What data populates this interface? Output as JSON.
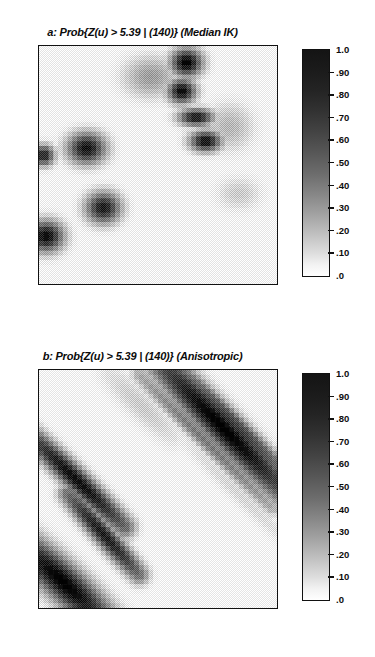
{
  "figure": {
    "background": "#ffffff",
    "ink": "#111111"
  },
  "panels": [
    {
      "id": "panel-a",
      "title": "a: Prob{Z(u) > 5.39 | (140)} (Median IK)",
      "label": "a",
      "estimator": "Median IK",
      "threshold": "5.39",
      "conditioning": "(140)"
    },
    {
      "id": "panel-b",
      "title": "b: Prob{Z(u) > 5.39 | (140)} (Anisotropic)",
      "label": "b",
      "estimator": "Anisotropic",
      "threshold": "5.39",
      "conditioning": "(140)"
    }
  ],
  "colorbar": {
    "min_label": ".0",
    "max_label": "1.0",
    "orientation": "vertical",
    "tick_labels": [
      "1.0",
      ".90",
      ".80",
      ".70",
      ".60",
      ".50",
      ".40",
      ".30",
      ".20",
      ".10",
      ".0"
    ],
    "tick_values": [
      1.0,
      0.9,
      0.8,
      0.7,
      0.6,
      0.5,
      0.4,
      0.3,
      0.2,
      0.1,
      0.0
    ],
    "high_color": "#141414",
    "low_color": "#ffffff"
  },
  "chart_data": [
    {
      "type": "heatmap",
      "panel": "a",
      "title": "a: Prob{Z(u) > 5.39 | (140)} (Median IK)",
      "xlabel": "",
      "ylabel": "",
      "grid": false,
      "legend": "colorbar-right",
      "zlim": [
        0.0,
        1.0
      ],
      "colormap": "grayscale-inverted",
      "nx": 50,
      "ny": 50,
      "description": "Median indicator kriging probability map: smooth low-probability background with compact high-probability blobs clustered in the upper-centre/right and along the left margin.",
      "hotspots": [
        {
          "cx": 0.62,
          "cy": 0.07,
          "rx": 0.09,
          "ry": 0.08,
          "peak": 1.0
        },
        {
          "cx": 0.6,
          "cy": 0.19,
          "rx": 0.08,
          "ry": 0.07,
          "peak": 0.97
        },
        {
          "cx": 0.66,
          "cy": 0.3,
          "rx": 0.1,
          "ry": 0.05,
          "peak": 0.92
        },
        {
          "cx": 0.7,
          "cy": 0.4,
          "rx": 0.09,
          "ry": 0.06,
          "peak": 0.95
        },
        {
          "cx": 0.2,
          "cy": 0.43,
          "rx": 0.11,
          "ry": 0.09,
          "peak": 0.93
        },
        {
          "cx": 0.02,
          "cy": 0.46,
          "rx": 0.06,
          "ry": 0.06,
          "peak": 0.88
        },
        {
          "cx": 0.27,
          "cy": 0.68,
          "rx": 0.1,
          "ry": 0.09,
          "peak": 0.9
        },
        {
          "cx": 0.03,
          "cy": 0.8,
          "rx": 0.1,
          "ry": 0.09,
          "peak": 0.96
        },
        {
          "cx": 0.47,
          "cy": 0.13,
          "rx": 0.16,
          "ry": 0.12,
          "peak": 0.4
        },
        {
          "cx": 0.8,
          "cy": 0.34,
          "rx": 0.14,
          "ry": 0.14,
          "peak": 0.3
        },
        {
          "cx": 0.84,
          "cy": 0.62,
          "rx": 0.13,
          "ry": 0.1,
          "peak": 0.22
        }
      ],
      "background_level": 0.04
    },
    {
      "type": "heatmap",
      "panel": "b",
      "title": "b: Prob{Z(u) > 5.39 | (140)} (Anisotropic)",
      "xlabel": "",
      "ylabel": "",
      "grid": false,
      "legend": "colorbar-right",
      "zlim": [
        0.0,
        1.0
      ],
      "colormap": "grayscale-inverted",
      "nx": 50,
      "ny": 50,
      "description": "Anisotropic indicator kriging probability map: high-probability values smeared into narrow NW-SE trending diagonal bands reflecting the anisotropic variogram.",
      "anisotropy_azimuth_deg": 135,
      "streaks": [
        {
          "x0": 0.5,
          "y0": -0.04,
          "x1": 1.04,
          "y1": 0.52,
          "width": 0.055,
          "peak": 1.0
        },
        {
          "x0": 0.58,
          "y0": -0.02,
          "x1": 1.06,
          "y1": 0.46,
          "width": 0.03,
          "peak": 0.75
        },
        {
          "x0": 0.42,
          "y0": 0.02,
          "x1": 0.98,
          "y1": 0.58,
          "width": 0.026,
          "peak": 0.55
        },
        {
          "x0": -0.05,
          "y0": 0.26,
          "x1": 0.36,
          "y1": 0.66,
          "width": 0.038,
          "peak": 0.95
        },
        {
          "x0": 0.12,
          "y0": 0.52,
          "x1": 0.42,
          "y1": 0.86,
          "width": 0.034,
          "peak": 0.9
        },
        {
          "x0": -0.08,
          "y0": 0.72,
          "x1": 0.28,
          "y1": 1.06,
          "width": 0.06,
          "peak": 1.0
        },
        {
          "x0": 0.3,
          "y0": 0.02,
          "x1": 0.56,
          "y1": 0.28,
          "width": 0.048,
          "peak": 0.22
        },
        {
          "x0": 0.62,
          "y0": 0.3,
          "x1": 1.04,
          "y1": 0.72,
          "width": 0.03,
          "peak": 0.18
        }
      ],
      "background_level": 0.03
    }
  ]
}
